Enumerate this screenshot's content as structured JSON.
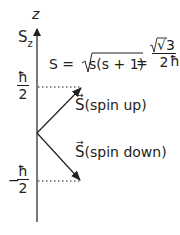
{
  "axis": {
    "axis_label": "z",
    "quantity_label": "S",
    "quantity_subscript": "z"
  },
  "levels": {
    "upper": {
      "sign": "",
      "numerator": "ħ",
      "denominator": "2"
    },
    "lower": {
      "sign": "−",
      "numerator": "ħ",
      "denominator": "2"
    }
  },
  "formula": {
    "lhs": "S =",
    "radicand": "s(s + 1)",
    "equals": "=",
    "frac_num": "√3",
    "frac_den": "2",
    "hbar": "ħ"
  },
  "vectors": {
    "up": {
      "symbol": "S",
      "label": "(spin up)"
    },
    "down": {
      "symbol": "S",
      "label": "(spin down)"
    }
  },
  "colors": {
    "ink": "#231f20",
    "background": "#ffffff"
  }
}
